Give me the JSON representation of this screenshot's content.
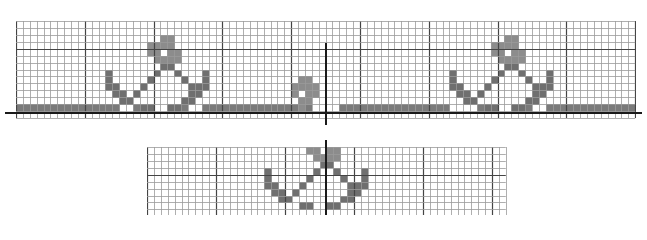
{
  "figure": {
    "colors": {
      "background": "#ffffff",
      "grid_minor": "#9a9a9a",
      "grid_major": "#444444",
      "fill_dark": "#6f6f6f",
      "fill_light": "#8c8c8c",
      "band": "#7a7a7a",
      "axis": "#1a1a1a"
    }
  },
  "top_chart": {
    "x": 16,
    "y": 21,
    "cols": 90,
    "rows": 14,
    "cell_w": 6.88,
    "cell_h": 6.93,
    "major_every": 10,
    "axis_row_y": 112,
    "axis_x_start": 5,
    "axis_x_end": 642,
    "center_axis_x": 325,
    "center_axis_y_start": 43,
    "center_axis_y_end": 125,
    "band": {
      "row": 12,
      "col_start": 0,
      "col_end": 89
    },
    "band_gaps": [
      15,
      16,
      19,
      20,
      21,
      22,
      25,
      26,
      43,
      44,
      45,
      46,
      63,
      64,
      65,
      66,
      69,
      70,
      71,
      72,
      75,
      76
    ],
    "motifs": [
      {
        "name": "left-anchor-flower",
        "offset_col": 13
      },
      {
        "name": "center-small-flower",
        "offset_col": 40,
        "type": "small"
      },
      {
        "name": "right-anchor-flower",
        "offset_col": 63
      }
    ]
  },
  "bottom_chart": {
    "x": 147,
    "y": 147,
    "cols": 52,
    "rows": 10,
    "cell_w": 6.9,
    "cell_h": 6.93,
    "major_every": 10,
    "center_axis_x": 325,
    "center_axis_y_start": 140,
    "center_axis_y_end": 215,
    "motifs": [
      {
        "name": "bottom-anchor-flower",
        "offset_col": 17,
        "offset_row": -3
      }
    ]
  },
  "anchor_motif_cells": [
    [
      1,
      8
    ],
    [
      1,
      9
    ],
    [
      2,
      6
    ],
    [
      2,
      7
    ],
    [
      2,
      8
    ],
    [
      2,
      9
    ],
    [
      3,
      6
    ],
    [
      3,
      7
    ],
    [
      3,
      9
    ],
    [
      3,
      10
    ],
    [
      4,
      7
    ],
    [
      4,
      8
    ],
    [
      4,
      9
    ],
    [
      4,
      10
    ],
    [
      5,
      8
    ],
    [
      5,
      9
    ],
    [
      6,
      0
    ],
    [
      6,
      7
    ],
    [
      6,
      10
    ],
    [
      6,
      14
    ],
    [
      7,
      0
    ],
    [
      7,
      6
    ],
    [
      7,
      11
    ],
    [
      7,
      14
    ],
    [
      8,
      0
    ],
    [
      8,
      1
    ],
    [
      8,
      5
    ],
    [
      8,
      12
    ],
    [
      8,
      13
    ],
    [
      8,
      14
    ],
    [
      9,
      1
    ],
    [
      9,
      2
    ],
    [
      9,
      4
    ],
    [
      9,
      12
    ],
    [
      9,
      13
    ],
    [
      10,
      2
    ],
    [
      10,
      3
    ],
    [
      10,
      11
    ],
    [
      10,
      12
    ],
    [
      11,
      5
    ],
    [
      11,
      6
    ],
    [
      11,
      9
    ],
    [
      11,
      10
    ]
  ],
  "small_motif_cells": [
    [
      9,
      1
    ],
    [
      9,
      2
    ],
    [
      10,
      0
    ],
    [
      10,
      1
    ],
    [
      10,
      2
    ],
    [
      10,
      3
    ],
    [
      11,
      0
    ],
    [
      11,
      2
    ],
    [
      11,
      3
    ],
    [
      12,
      1
    ],
    [
      12,
      2
    ],
    [
      13,
      1
    ]
  ]
}
